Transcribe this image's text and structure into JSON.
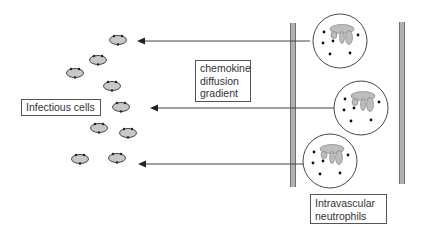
{
  "labels": {
    "infectious_cells": "Infectious cells",
    "chemokine": {
      "line1": "chemokine",
      "line2": "diffusion",
      "line3": "gradient"
    },
    "neutrophils": {
      "line1": "Intravascular",
      "line2": "neutrophils"
    }
  },
  "colors": {
    "stroke": "#333333",
    "cell_fill": "#c8c8c8",
    "vessel_wall": "#999999",
    "arrow": "#444444"
  },
  "infectious_cells": [
    {
      "cx": 118,
      "cy": 40
    },
    {
      "cx": 98,
      "cy": 60
    },
    {
      "cx": 75,
      "cy": 73
    },
    {
      "cx": 112,
      "cy": 86
    },
    {
      "cx": 121,
      "cy": 107
    },
    {
      "cx": 99,
      "cy": 128
    },
    {
      "cx": 128,
      "cy": 133
    },
    {
      "cx": 80,
      "cy": 159
    },
    {
      "cx": 117,
      "cy": 158
    }
  ],
  "neutrophils": [
    {
      "cx": 340,
      "cy": 41
    },
    {
      "cx": 361,
      "cy": 108
    },
    {
      "cx": 330,
      "cy": 161
    }
  ],
  "arrows": [
    {
      "x1": 310,
      "y1": 41,
      "x2": 137,
      "y2": 41
    },
    {
      "x1": 335,
      "y1": 108,
      "x2": 150,
      "y2": 108
    },
    {
      "x1": 303,
      "y1": 164,
      "x2": 138,
      "y2": 164
    }
  ]
}
